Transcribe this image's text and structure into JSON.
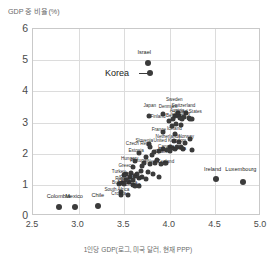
{
  "chart_data": {
    "type": "scatter",
    "title": "",
    "ylabel": "GDP 중 비율(%)",
    "xlabel": "1인당 GDP(로그, 미국 달러, 현재 PPP)",
    "xlim": [
      2.5,
      5.0
    ],
    "ylim": [
      0,
      6
    ],
    "xticks": [
      "2.5",
      "3.0",
      "3.5",
      "4.0",
      "4.5",
      "5.0"
    ],
    "xtick_values": [
      2.5,
      3.0,
      3.5,
      4.0,
      4.5,
      5.0
    ],
    "yticks": [
      "0",
      "1",
      "2",
      "3",
      "4",
      "5",
      "6"
    ],
    "ytick_values": [
      0,
      1,
      2,
      3,
      4,
      5,
      6
    ],
    "grid": true,
    "legend": "none",
    "marker_color": "#3b3b3b",
    "grid_color": "#dcdcdc",
    "axis_color": "#c9c9c9",
    "points": [
      {
        "label": "Israel",
        "x": 3.76,
        "y": 4.92,
        "lx": 3.72,
        "ly": 5.22,
        "style": "clear"
      },
      {
        "label": "Korea",
        "x": 3.78,
        "y": 4.58,
        "lx": 3.42,
        "ly": 4.58,
        "style": "korea"
      },
      {
        "label": "Sweden",
        "x": 4.09,
        "y": 3.32,
        "lx": 4.05,
        "ly": 3.72,
        "style": "small"
      },
      {
        "label": "Japan",
        "x": 3.92,
        "y": 3.28,
        "lx": 3.78,
        "ly": 3.52,
        "style": "small"
      },
      {
        "label": "Denmark",
        "x": 4.06,
        "y": 3.22,
        "lx": 3.98,
        "ly": 3.5,
        "style": "small"
      },
      {
        "label": "Switzerland",
        "x": 4.18,
        "y": 3.3,
        "lx": 4.15,
        "ly": 3.52,
        "style": "small"
      },
      {
        "label": "Austria",
        "x": 4.11,
        "y": 3.14,
        "lx": 4.08,
        "ly": 3.38,
        "style": "small"
      },
      {
        "label": "Germany",
        "x": 4.13,
        "y": 3.12,
        "lx": 4.12,
        "ly": 3.28,
        "style": "small"
      },
      {
        "label": "Finland",
        "x": 3.77,
        "y": 3.2,
        "lx": 3.87,
        "ly": 3.18,
        "style": "small"
      },
      {
        "label": "United States",
        "x": 4.22,
        "y": 3.1,
        "lx": 4.2,
        "ly": 3.34,
        "style": "small"
      },
      {
        "label": "Belgium",
        "x": 4.07,
        "y": 2.96,
        "lx": 4.05,
        "ly": 3.22,
        "style": "small"
      },
      {
        "label": "Iceland",
        "x": 4.06,
        "y": 2.62,
        "lx": 4.05,
        "ly": 2.8,
        "style": "small"
      },
      {
        "label": "France",
        "x": 4.02,
        "y": 2.9,
        "lx": 3.88,
        "ly": 2.75,
        "style": "small"
      },
      {
        "label": "Netherlands",
        "x": 4.05,
        "y": 2.42,
        "lx": 3.98,
        "ly": 2.52,
        "style": "small"
      },
      {
        "label": "Norway",
        "x": 4.22,
        "y": 2.48,
        "lx": 4.18,
        "ly": 2.52,
        "style": "small"
      },
      {
        "label": "Slovenia",
        "x": 3.77,
        "y": 2.32,
        "lx": 3.72,
        "ly": 2.42,
        "style": "small"
      },
      {
        "label": "Czech Rep.",
        "x": 3.78,
        "y": 2.22,
        "lx": 3.65,
        "ly": 2.3,
        "style": "small"
      },
      {
        "label": "United Kingdom",
        "x": 4.08,
        "y": 2.2,
        "lx": 4.0,
        "ly": 2.4,
        "style": "small"
      },
      {
        "label": "Canada",
        "x": 4.02,
        "y": 2.18,
        "lx": 3.96,
        "ly": 2.2,
        "style": "small"
      },
      {
        "label": "Australia",
        "x": 4.15,
        "y": 2.16,
        "lx": 4.08,
        "ly": 2.15,
        "style": "small"
      },
      {
        "label": "Italy",
        "x": 4.0,
        "y": 2.1,
        "lx": 3.92,
        "ly": 2.12,
        "style": "small"
      },
      {
        "label": "Estonia",
        "x": 3.66,
        "y": 2.02,
        "lx": 3.63,
        "ly": 2.1,
        "style": "small"
      },
      {
        "label": "Ireland",
        "x": 4.51,
        "y": 1.18,
        "lx": 4.47,
        "ly": 1.48,
        "style": "clear"
      },
      {
        "label": "Luxembourg",
        "x": 4.8,
        "y": 1.1,
        "lx": 4.78,
        "ly": 1.46,
        "style": "clear"
      },
      {
        "label": "Spain",
        "x": 3.97,
        "y": 2.12,
        "lx": 3.9,
        "ly": 2.05,
        "style": "small"
      },
      {
        "label": "Portugal",
        "x": 3.72,
        "y": 1.7,
        "lx": 3.66,
        "ly": 1.75,
        "style": "small"
      },
      {
        "label": "Hungary",
        "x": 3.62,
        "y": 1.75,
        "lx": 3.56,
        "ly": 1.82,
        "style": "small"
      },
      {
        "label": "Greece",
        "x": 3.6,
        "y": 1.56,
        "lx": 3.52,
        "ly": 1.62,
        "style": "small"
      },
      {
        "label": "Turkey",
        "x": 3.5,
        "y": 1.3,
        "lx": 3.44,
        "ly": 1.42,
        "style": "small"
      },
      {
        "label": "Poland",
        "x": 3.62,
        "y": 1.28,
        "lx": 3.56,
        "ly": 1.3,
        "style": "small"
      },
      {
        "label": "Slovak Rep.",
        "x": 3.66,
        "y": 1.22,
        "lx": 3.58,
        "ly": 1.22,
        "style": "small"
      },
      {
        "label": "Latvia",
        "x": 3.55,
        "y": 1.08,
        "lx": 3.5,
        "ly": 1.12,
        "style": "small"
      },
      {
        "label": "Lithuania",
        "x": 3.6,
        "y": 1.0,
        "lx": 3.54,
        "ly": 1.05,
        "style": "small"
      },
      {
        "label": "Colombia",
        "x": 2.79,
        "y": 0.3,
        "lx": 2.78,
        "ly": 0.62,
        "style": "clear"
      },
      {
        "label": "Mexico",
        "x": 2.96,
        "y": 0.28,
        "lx": 2.95,
        "ly": 0.62,
        "style": "clear"
      },
      {
        "label": "Chile",
        "x": 3.21,
        "y": 0.32,
        "lx": 3.21,
        "ly": 0.64,
        "style": "clear"
      },
      {
        "label": "New Zealand",
        "x": 3.95,
        "y": 1.7,
        "lx": 3.9,
        "ly": 1.72,
        "style": "small"
      },
      {
        "label": "Russia",
        "x": 3.52,
        "y": 1.15,
        "lx": 3.48,
        "ly": 1.18,
        "style": "small"
      },
      {
        "label": "South Africa",
        "x": 3.47,
        "y": 0.78,
        "lx": 3.42,
        "ly": 0.85,
        "style": "small"
      },
      {
        "label": "Croatia",
        "x": 3.46,
        "y": 0.68,
        "lx": 3.44,
        "ly": 0.72,
        "style": "small"
      },
      {
        "label": "Romania",
        "x": 3.62,
        "y": 0.95,
        "lx": 3.58,
        "ly": 0.98,
        "style": "small"
      },
      {
        "label": "Bulgaria",
        "x": 3.5,
        "y": 1.02,
        "lx": 3.46,
        "ly": 1.05,
        "style": "small"
      }
    ],
    "extra_points": [
      {
        "x": 4.1,
        "y": 3.22
      },
      {
        "x": 4.16,
        "y": 3.18
      },
      {
        "x": 4.21,
        "y": 3.14
      },
      {
        "x": 4.24,
        "y": 3.1
      },
      {
        "x": 4.04,
        "y": 3.1
      },
      {
        "x": 3.99,
        "y": 3.05
      },
      {
        "x": 4.12,
        "y": 2.92
      },
      {
        "x": 3.93,
        "y": 2.7
      },
      {
        "x": 4.1,
        "y": 2.38
      },
      {
        "x": 4.17,
        "y": 2.34
      },
      {
        "x": 4.24,
        "y": 2.12
      },
      {
        "x": 4.12,
        "y": 2.2
      },
      {
        "x": 4.06,
        "y": 2.14
      },
      {
        "x": 3.88,
        "y": 2.08
      },
      {
        "x": 3.83,
        "y": 2.04
      },
      {
        "x": 3.92,
        "y": 2.16
      },
      {
        "x": 3.8,
        "y": 1.95
      },
      {
        "x": 3.74,
        "y": 1.88
      },
      {
        "x": 3.86,
        "y": 1.8
      },
      {
        "x": 3.78,
        "y": 1.66
      },
      {
        "x": 3.7,
        "y": 1.6
      },
      {
        "x": 3.84,
        "y": 1.7
      },
      {
        "x": 3.9,
        "y": 1.68
      },
      {
        "x": 3.68,
        "y": 1.44
      },
      {
        "x": 3.76,
        "y": 1.4
      },
      {
        "x": 3.82,
        "y": 1.36
      },
      {
        "x": 3.58,
        "y": 1.38
      },
      {
        "x": 3.64,
        "y": 1.34
      },
      {
        "x": 3.7,
        "y": 1.26
      },
      {
        "x": 3.74,
        "y": 1.2
      },
      {
        "x": 3.56,
        "y": 1.24
      },
      {
        "x": 3.52,
        "y": 1.36
      },
      {
        "x": 3.48,
        "y": 1.06
      },
      {
        "x": 3.44,
        "y": 1.02
      },
      {
        "x": 3.66,
        "y": 0.96
      },
      {
        "x": 3.6,
        "y": 1.14
      },
      {
        "x": 3.88,
        "y": 1.24
      },
      {
        "x": 3.96,
        "y": 1.7
      },
      {
        "x": 4.0,
        "y": 2.2
      },
      {
        "x": 3.54,
        "y": 0.68
      }
    ]
  }
}
